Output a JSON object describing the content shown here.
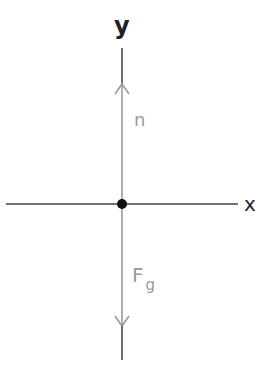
{
  "diagram": {
    "type": "free-body-diagram",
    "axes": {
      "x_label": "x",
      "y_label": "y"
    },
    "forces": [
      {
        "name": "normal",
        "label": "n",
        "direction": "up",
        "color": "#9a9a9a"
      },
      {
        "name": "gravity",
        "label": "F",
        "subscript": "g",
        "direction": "down",
        "color": "#9a9a9a"
      }
    ],
    "colors": {
      "axis": "#3a3a3a",
      "force": "#9a9a9a",
      "object": "#111111",
      "background": "#ffffff"
    }
  }
}
